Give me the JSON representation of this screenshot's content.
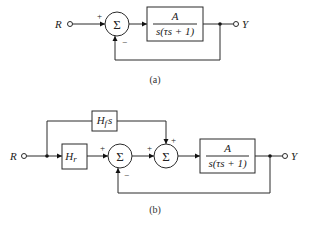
{
  "diagram_a": {
    "input_label": "R",
    "output_label": "Y",
    "summer_symbol": "Σ",
    "summer_signs": {
      "left": "+",
      "bottom": "−"
    },
    "plant": {
      "numerator": "A",
      "denominator": "s(τs + 1)"
    },
    "caption": "(a)"
  },
  "diagram_b": {
    "input_label": "R",
    "output_label": "Y",
    "feedforward_block": {
      "label_main": "H",
      "label_sub": "f",
      "label_suffix": "s"
    },
    "reference_block": {
      "label_main": "H",
      "label_sub": "r"
    },
    "summer1": {
      "symbol": "Σ",
      "signs": {
        "left": "+",
        "bottom": "−"
      }
    },
    "summer2": {
      "symbol": "Σ",
      "signs": {
        "left": "+",
        "top": "+"
      }
    },
    "plant": {
      "numerator": "A",
      "denominator": "s(τs + 1)"
    },
    "caption": "(b)"
  }
}
